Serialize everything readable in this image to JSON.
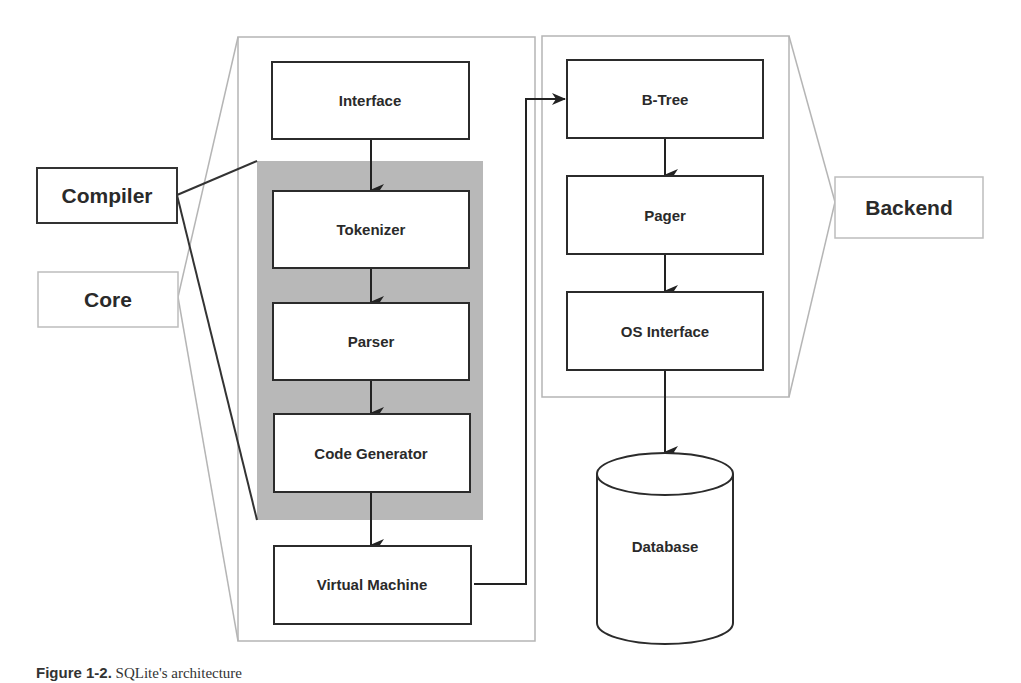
{
  "diagram": {
    "colors": {
      "box_border": "#2b2b2b",
      "group_border": "#b5b5b5",
      "compiler_fill": "#b8b8b8",
      "text": "#2a2a2a"
    },
    "side_labels": {
      "compiler": "Compiler",
      "core": "Core",
      "backend": "Backend"
    },
    "core_modules": [
      {
        "id": "interface",
        "label": "Interface"
      },
      {
        "id": "tokenizer",
        "label": "Tokenizer"
      },
      {
        "id": "parser",
        "label": "Parser"
      },
      {
        "id": "code_generator",
        "label": "Code Generator"
      },
      {
        "id": "virtual_machine",
        "label": "Virtual Machine"
      }
    ],
    "backend_modules": [
      {
        "id": "btree",
        "label": "B-Tree"
      },
      {
        "id": "pager",
        "label": "Pager"
      },
      {
        "id": "os_interface",
        "label": "OS Interface"
      }
    ],
    "storage": {
      "label": "Database"
    },
    "edges": [
      {
        "from": "Interface",
        "to": "Tokenizer"
      },
      {
        "from": "Tokenizer",
        "to": "Parser"
      },
      {
        "from": "Parser",
        "to": "Code Generator"
      },
      {
        "from": "Code Generator",
        "to": "Virtual Machine"
      },
      {
        "from": "Virtual Machine",
        "to": "B-Tree"
      },
      {
        "from": "B-Tree",
        "to": "Pager"
      },
      {
        "from": "Pager",
        "to": "OS Interface"
      },
      {
        "from": "OS Interface",
        "to": "Database"
      }
    ]
  },
  "caption": {
    "figure_label": "Figure 1-2.",
    "text": "SQLite's architecture"
  }
}
